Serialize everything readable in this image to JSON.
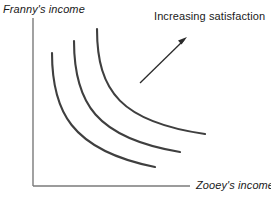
{
  "figure": {
    "type": "indifference-curve-diagram",
    "background_color": "#ffffff",
    "axis_color": "#7a7a7a",
    "curve_color": "#3f3f3f",
    "arrow_color": "#2b2b2b",
    "text_color": "#1a1a1a"
  },
  "axes": {
    "y_label": "Franny's income",
    "x_label": "Zooey's income",
    "origin": {
      "x": 33,
      "y": 186
    },
    "y_top": 18,
    "x_right": 190
  },
  "annotation": {
    "label": "Increasing satisfaction",
    "arrow": {
      "tail_x": 140,
      "tail_y": 83,
      "tip_x": 187,
      "tip_y": 37
    }
  },
  "chart_data": {
    "type": "line",
    "title": "",
    "xlabel": "Zooey's income",
    "ylabel": "Franny's income",
    "grid": false,
    "legend": "none",
    "annotations": [
      "Increasing satisfaction"
    ],
    "series": [
      {
        "name": "indifference-curve-1",
        "path": "M 52,53 C 52,110 70,150 155,167",
        "start": [
          52,
          53
        ],
        "end": [
          155,
          167
        ]
      },
      {
        "name": "indifference-curve-2",
        "path": "M 74,41 C 74,103 96,138 180,152",
        "start": [
          74,
          41
        ],
        "end": [
          180,
          152
        ]
      },
      {
        "name": "indifference-curve-3",
        "path": "M 97,29 C 97,92 122,122 205,134",
        "start": [
          97,
          29
        ],
        "end": [
          205,
          134
        ]
      }
    ]
  }
}
